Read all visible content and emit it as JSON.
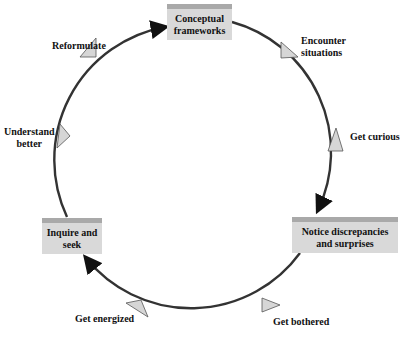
{
  "diagram": {
    "type": "cycle",
    "boxes": {
      "top": {
        "line1": "Conceptual",
        "line2": "frameworks"
      },
      "right": {
        "line1": "Notice discrepancies",
        "line2": "and surprises"
      },
      "left": {
        "line1": "Inquire and",
        "line2": "seek"
      }
    },
    "steps": {
      "encounter": {
        "line1": "Encounter",
        "line2": "situations"
      },
      "curious": "Get curious",
      "bothered": "Get bothered",
      "energized": "Get energized",
      "understand": {
        "line1": "Understand",
        "line2": "better"
      },
      "reformulate": "Reformulate"
    },
    "colors": {
      "box_fill": "#d9d9d9",
      "box_top": "#a9a9a9",
      "circle_stroke": "#333333",
      "marker_fill": "#d6d6d6"
    }
  }
}
